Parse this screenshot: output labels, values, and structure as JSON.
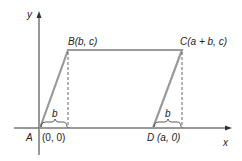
{
  "diagram": {
    "type": "parallelogram-coordinate-proof",
    "axes": {
      "x_label": "x",
      "y_label": "y"
    },
    "points": [
      {
        "name": "A",
        "coords": "(0, 0)"
      },
      {
        "name": "B",
        "label": "B(b, c)"
      },
      {
        "name": "C",
        "label": "C(a + b, c)"
      },
      {
        "name": "D",
        "label": "D (a, 0)"
      }
    ],
    "brace_labels": [
      "b",
      "b"
    ],
    "colors": {
      "shape": "#9a9a9a",
      "axes": "#333333",
      "dashed": "#555555"
    }
  }
}
